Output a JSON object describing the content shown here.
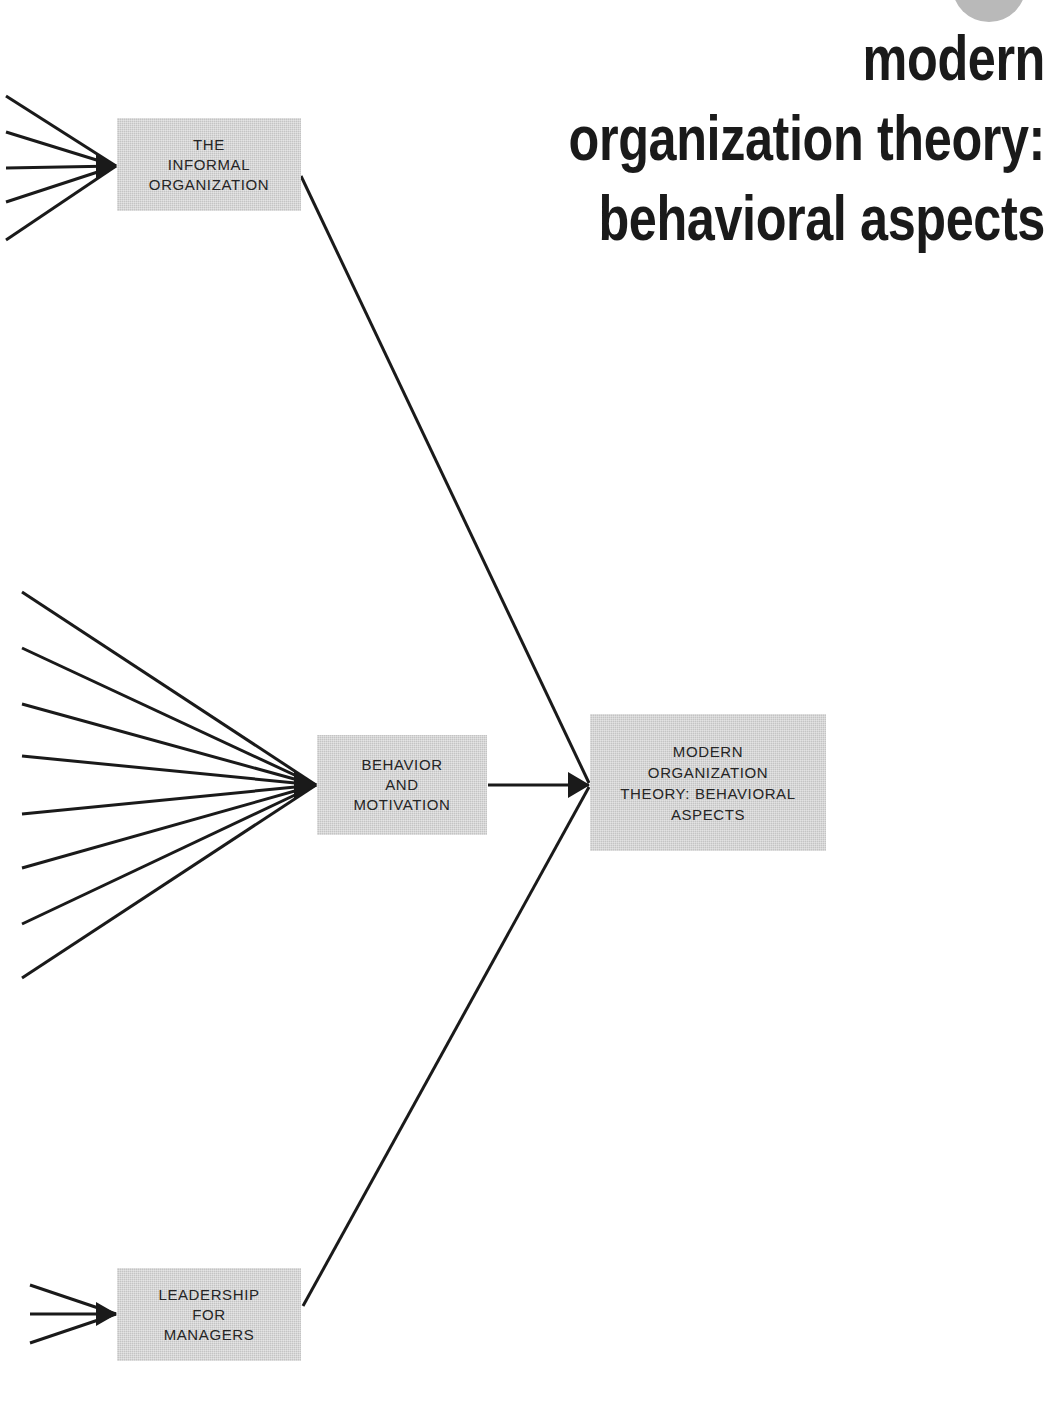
{
  "page": {
    "width": 1051,
    "height": 1409,
    "background_color": "#ffffff",
    "ink_color": "#1a1a1a",
    "box_fill_color": "#c4c4c4",
    "marker_color": "#b9b9b9"
  },
  "title": {
    "name": "chapter-title",
    "lines": [
      "modern",
      "organization  theory:",
      "behavioral  aspects"
    ],
    "full_text": "modern organization theory: behavioral aspects"
  },
  "diagram": {
    "type": "convergent-tree",
    "nodes": [
      {
        "id": "informal-organization",
        "label": "THE\nINFORMAL\nORGANIZATION",
        "incoming_line_count": 5
      },
      {
        "id": "behavior-motivation",
        "label": "BEHAVIOR\nAND\nMOTIVATION",
        "incoming_line_count": 8
      },
      {
        "id": "leadership-managers",
        "label": "LEADERSHIP\nFOR\nMANAGERS",
        "incoming_line_count": 3
      },
      {
        "id": "modern-org-theory",
        "label": "MODERN\nORGANIZATION\nTHEORY: BEHAVIORAL\nASPECTS",
        "incoming_line_count": 3
      }
    ],
    "edges": [
      {
        "from": "informal-organization",
        "to": "modern-org-theory"
      },
      {
        "from": "behavior-motivation",
        "to": "modern-org-theory"
      },
      {
        "from": "leadership-managers",
        "to": "modern-org-theory"
      }
    ]
  }
}
